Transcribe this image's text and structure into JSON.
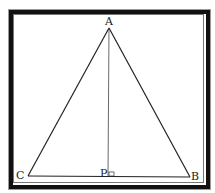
{
  "figure": {
    "type": "isosceles triangle with altitude",
    "points": {
      "A": {
        "label": "A"
      },
      "B": {
        "label": "B"
      },
      "C": {
        "label": "C"
      },
      "P": {
        "label": "P"
      }
    },
    "segments": [
      "AB",
      "AC",
      "CB",
      "AP"
    ],
    "annotations": [
      "right-angle marker at P"
    ],
    "colors": {
      "line": "#222222",
      "frame": "#111111",
      "background": "#ffffff"
    }
  }
}
